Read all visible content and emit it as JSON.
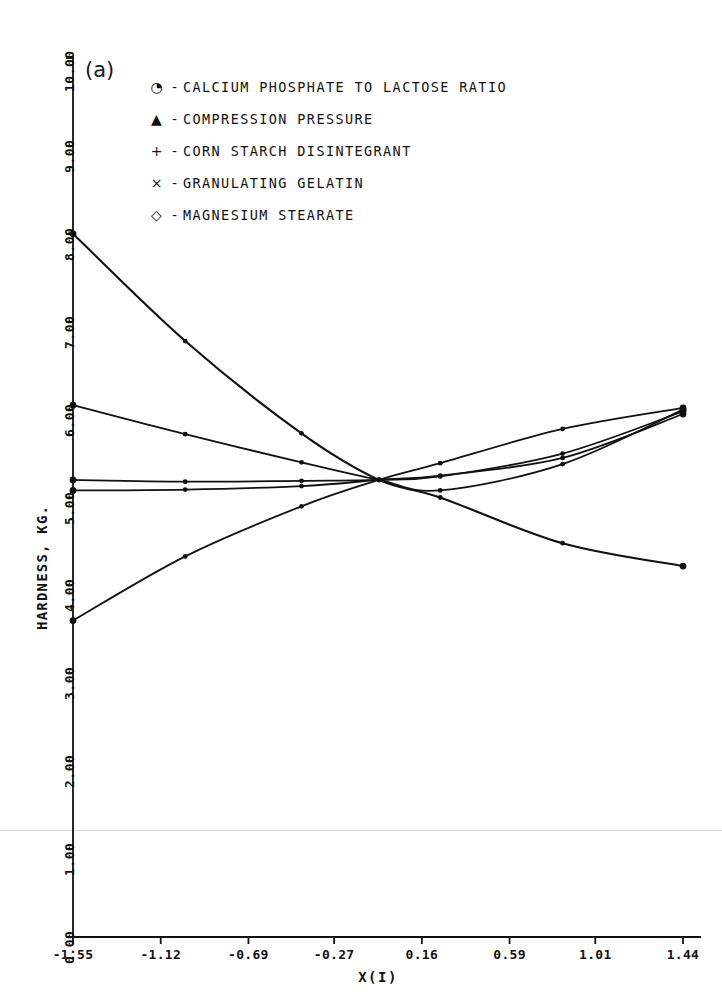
{
  "figure": {
    "panel_tag": "(a)"
  },
  "chart_data": {
    "type": "line",
    "title": "",
    "subtitle": "",
    "xlabel": "X(I)",
    "ylabel": "HARDNESS, KG.",
    "xlim": [
      -1.55,
      1.44
    ],
    "ylim": [
      0.0,
      10.0
    ],
    "grid": false,
    "legend_position": "top-center",
    "xticks": [
      "-1.55",
      "-1.12",
      "-0.69",
      "-0.27",
      "0.16",
      "0.59",
      "1.01",
      "1.44"
    ],
    "xtick_values": [
      -1.55,
      -1.12,
      -0.69,
      -0.27,
      0.16,
      0.59,
      1.01,
      1.44
    ],
    "yticks": [
      "0.00",
      "1.00",
      "2.00",
      "3.00",
      "4.00",
      "5.00",
      "6.00",
      "7.00",
      "8.00",
      "9.00",
      "10.00"
    ],
    "ytick_values": [
      0,
      1,
      2,
      3,
      4,
      5,
      6,
      7,
      8,
      9,
      10
    ],
    "x": [
      -1.55,
      -1.0,
      -0.43,
      -0.05,
      0.25,
      0.85,
      1.44
    ],
    "series": [
      {
        "name": "CALCIUM PHOSPHATE TO LACTOSE RATIO",
        "marker": "circle-dot",
        "marker_glyph": "◔",
        "values": [
          8.0,
          6.78,
          5.73,
          5.2,
          5.0,
          4.48,
          4.22
        ]
      },
      {
        "name": "COMPRESSION PRESSURE",
        "marker": "triangle",
        "marker_glyph": "▲",
        "values": [
          3.6,
          4.33,
          4.9,
          5.2,
          5.39,
          5.78,
          6.02
        ]
      },
      {
        "name": "CORN STARCH DISINTEGRANT",
        "marker": "plus",
        "marker_glyph": "+",
        "values": [
          5.08,
          5.09,
          5.13,
          5.2,
          5.25,
          5.45,
          5.95
        ]
      },
      {
        "name": "GRANULATING GELATIN",
        "marker": "cross",
        "marker_glyph": "×",
        "values": [
          5.2,
          5.18,
          5.19,
          5.2,
          5.24,
          5.5,
          5.98
        ]
      },
      {
        "name": "MAGNESIUM STEARATE",
        "marker": "diamond",
        "marker_glyph": "◇",
        "values": [
          6.05,
          5.72,
          5.4,
          5.2,
          5.08,
          5.38,
          6.0
        ]
      }
    ],
    "colors": {
      "line": "#111111",
      "axis": "#111111",
      "background": "#ffffff"
    }
  },
  "legend": {
    "rows": [
      {
        "marker": "◔",
        "dash": "-",
        "label": "CALCIUM PHOSPHATE TO LACTOSE RATIO"
      },
      {
        "marker": "▲",
        "dash": "-",
        "label": "COMPRESSION PRESSURE"
      },
      {
        "marker": "+",
        "dash": "-",
        "label": "CORN STARCH DISINTEGRANT"
      },
      {
        "marker": "×",
        "dash": "-",
        "label": "GRANULATING GELATIN"
      },
      {
        "marker": "◇",
        "dash": "-",
        "label": "MAGNESIUM STEARATE"
      }
    ]
  }
}
